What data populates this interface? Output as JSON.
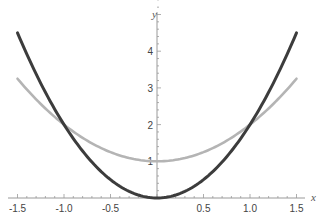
{
  "chart_data": {
    "type": "line",
    "title": "",
    "xlabel": "x",
    "ylabel": "y",
    "xlim": [
      -1.5,
      1.5
    ],
    "ylim": [
      0,
      4.7
    ],
    "x_ticks": [
      "-1.5",
      "-1.0",
      "-0.5",
      "0.5",
      "1.0",
      "1.5"
    ],
    "y_ticks": [
      "1",
      "2",
      "3",
      "4"
    ],
    "grid": false,
    "series": [
      {
        "name": "2x^2",
        "color": "#3c3c3c",
        "x": [
          -1.5,
          -1.25,
          -1,
          -0.75,
          -0.5,
          -0.25,
          0,
          0.25,
          0.5,
          0.75,
          1,
          1.25,
          1.5
        ],
        "values": [
          4.5,
          3.125,
          2,
          1.125,
          0.5,
          0.125,
          0,
          0.125,
          0.5,
          1.125,
          2,
          3.125,
          4.5
        ]
      },
      {
        "name": "x^2+1",
        "color": "#b4b4b4",
        "x": [
          -1.5,
          -1.25,
          -1,
          -0.75,
          -0.5,
          -0.25,
          0,
          0.25,
          0.5,
          0.75,
          1,
          1.25,
          1.5
        ],
        "values": [
          3.25,
          2.5625,
          2,
          1.5625,
          1.25,
          1.0625,
          1,
          1.0625,
          1.25,
          1.5625,
          2,
          2.5625,
          3.25
        ]
      }
    ]
  }
}
